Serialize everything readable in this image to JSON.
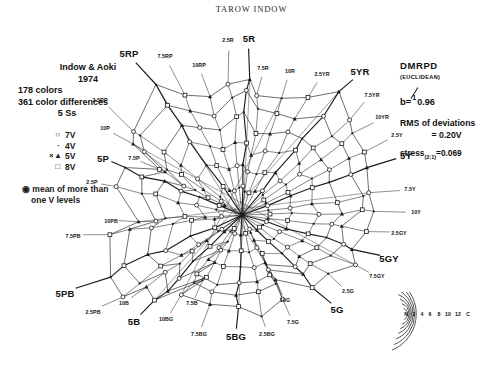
{
  "figure": {
    "title": "TAROW INDOW"
  },
  "caption": {
    "line1": "Indow & Aoki",
    "line2": "1974",
    "line3": "178 colors",
    "line4": "361 color differences",
    "line5": "5 Ss"
  },
  "legend": {
    "items": [
      {
        "symbol": "○",
        "label": "7V"
      },
      {
        "symbol": "·",
        "label": "4V"
      },
      {
        "symbol": "× ▴",
        "label": "5V"
      },
      {
        "symbol": "□",
        "label": "8V"
      }
    ],
    "note_line1": "◉ mean of more than",
    "note_line2": "one V levels"
  },
  "stats": {
    "header": "DMRPD",
    "subheader": "(EUCLIDEAN)",
    "b_label": "b=",
    "b_numerator": "1",
    "b_denominator": "0.96",
    "rms_label": "RMS of deviations",
    "rms_value": "= 0.20V",
    "stress_label": "stress",
    "stress_sub": "(2;1)",
    "stress_value": "=0.069"
  },
  "chart_data": {
    "type": "scatter",
    "title": "TAROW INDOW",
    "subtitle": "Munsell hue-chroma MDS configuration (Indow & Aoki, 1974)",
    "xlabel": "",
    "ylabel": "",
    "grid": false,
    "legend_position": "left",
    "radial_axis": "Munsell chroma",
    "angular_axis": "Munsell hue",
    "chroma_levels": [
      2,
      4,
      6,
      8,
      10,
      12,
      14
    ],
    "center_label": "N",
    "hue_labels": [
      {
        "name": "5R",
        "major": true,
        "x": 249,
        "y": 38
      },
      {
        "name": "7.5R",
        "major": false,
        "x": 263,
        "y": 68
      },
      {
        "name": "10R",
        "major": false,
        "x": 290,
        "y": 71
      },
      {
        "name": "2.5YR",
        "major": false,
        "x": 322,
        "y": 74
      },
      {
        "name": "5YR",
        "major": true,
        "x": 360,
        "y": 71
      },
      {
        "name": "7.5YR",
        "major": false,
        "x": 372,
        "y": 95
      },
      {
        "name": "10YR",
        "major": false,
        "x": 382,
        "y": 117
      },
      {
        "name": "2.5Y",
        "major": false,
        "x": 397,
        "y": 135
      },
      {
        "name": "5Y",
        "major": true,
        "x": 406,
        "y": 155
      },
      {
        "name": "7.5Y",
        "major": false,
        "x": 410,
        "y": 189
      },
      {
        "name": "10Y",
        "major": false,
        "x": 416,
        "y": 212
      },
      {
        "name": "2.5GY",
        "major": false,
        "x": 399,
        "y": 233
      },
      {
        "name": "5GY",
        "major": true,
        "x": 389,
        "y": 258
      },
      {
        "name": "7.5GY",
        "major": false,
        "x": 377,
        "y": 276
      },
      {
        "name": "2.5G",
        "major": false,
        "x": 348,
        "y": 291
      },
      {
        "name": "5G",
        "major": true,
        "x": 337,
        "y": 309
      },
      {
        "name": "10G",
        "major": false,
        "x": 285,
        "y": 300
      },
      {
        "name": "7.5G",
        "major": false,
        "x": 293,
        "y": 322
      },
      {
        "name": "2.5BG",
        "major": false,
        "x": 267,
        "y": 334
      },
      {
        "name": "5BG",
        "major": true,
        "x": 236,
        "y": 336
      },
      {
        "name": "7.5BG",
        "major": false,
        "x": 199,
        "y": 334
      },
      {
        "name": "10BG",
        "major": false,
        "x": 166,
        "y": 319
      },
      {
        "name": "7.5B",
        "major": false,
        "x": 192,
        "y": 303
      },
      {
        "name": "5B",
        "major": true,
        "x": 134,
        "y": 321
      },
      {
        "name": "10B",
        "major": false,
        "x": 124,
        "y": 303
      },
      {
        "name": "2.5PB",
        "major": false,
        "x": 93,
        "y": 312
      },
      {
        "name": "5PB",
        "major": true,
        "x": 65,
        "y": 293
      },
      {
        "name": "7.5PB",
        "major": false,
        "x": 73,
        "y": 236
      },
      {
        "name": "10PB",
        "major": false,
        "x": 111,
        "y": 221
      },
      {
        "name": "2.5P",
        "major": false,
        "x": 92,
        "y": 182
      },
      {
        "name": "5P",
        "major": true,
        "x": 103,
        "y": 158
      },
      {
        "name": "7.5P",
        "major": false,
        "x": 134,
        "y": 158
      },
      {
        "name": "10P",
        "major": false,
        "x": 105,
        "y": 128
      },
      {
        "name": "2.5RP",
        "major": false,
        "x": 100,
        "y": 100
      },
      {
        "name": "5RP",
        "major": true,
        "x": 129,
        "y": 53
      },
      {
        "name": "7.5RP",
        "major": false,
        "x": 165,
        "y": 56
      },
      {
        "name": "10RP",
        "major": false,
        "x": 199,
        "y": 65
      },
      {
        "name": "2.5R",
        "major": false,
        "x": 228,
        "y": 40
      }
    ]
  },
  "chroma_key": {
    "labels": [
      "N",
      "2",
      "4",
      "6",
      "8",
      "10",
      "12",
      "C"
    ],
    "arc_count": 7
  }
}
